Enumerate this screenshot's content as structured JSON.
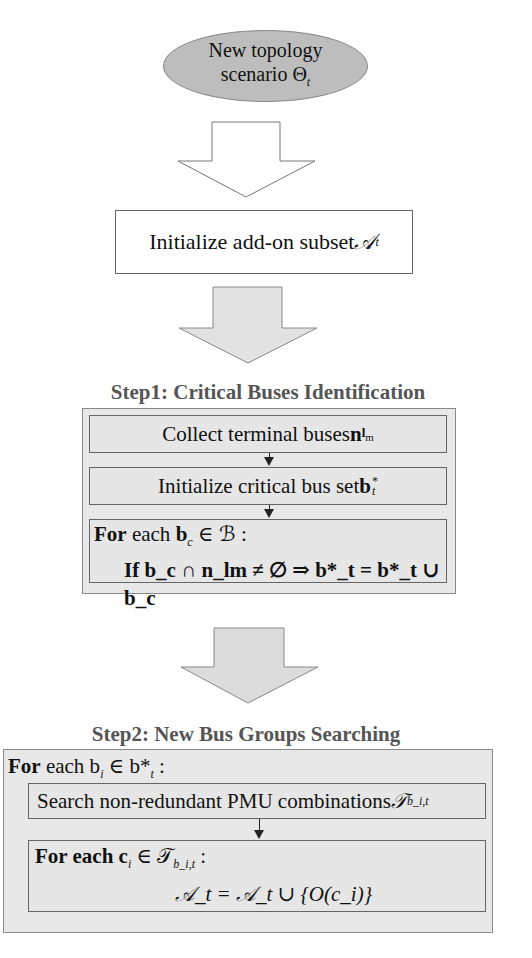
{
  "start": {
    "line1": "New topology",
    "line2": "scenario Θ",
    "line2_sub": "t"
  },
  "init": {
    "text": "Initialize add-on subset ",
    "symbol": "𝒜",
    "sub": "t"
  },
  "step1": {
    "heading": "Step1: Critical Buses Identification",
    "box1": {
      "text": "Collect terminal buses ",
      "sym": "n",
      "sub": "l",
      "subsub": "m"
    },
    "box2": {
      "text": "Initialize critical bus set ",
      "sym": "b",
      "sub": "t",
      "sup": "*"
    },
    "box3": {
      "for_kw": "For",
      "line1": " each ",
      "line1_math": "b",
      "line1_sub": "c",
      "line1_rest": " ∈ ℬ  :",
      "if_kw": "If",
      "line2": "b_c ∩ n_lm ≠ ∅ ⇒ b*_t = b*_t ∪ b_c"
    }
  },
  "step2": {
    "heading": "Step2: New Bus Groups Searching",
    "for_line": {
      "kw": "For",
      "text": " each b",
      "sub": "i",
      "rest": " ∈ b*",
      "rest_sub": "t",
      "colon": "  :"
    },
    "search_box": {
      "text": "Search non-redundant PMU combinations ",
      "sym": "𝒯",
      "sub": "b_i,t"
    },
    "inner_for": {
      "kw": "For",
      "text": " each c",
      "sub": "i",
      "rest": " ∈ 𝒯",
      "rest_sub": "b_i,t",
      "colon": " :"
    },
    "update": "𝒜_t = 𝒜_t ∪ {O(c_i)}"
  },
  "colors": {
    "ellipse_fill": "#bdbdbd",
    "box_fill": "#e8e8e8",
    "heading": "#555555",
    "arrow_fill": "#e0e0e0"
  }
}
